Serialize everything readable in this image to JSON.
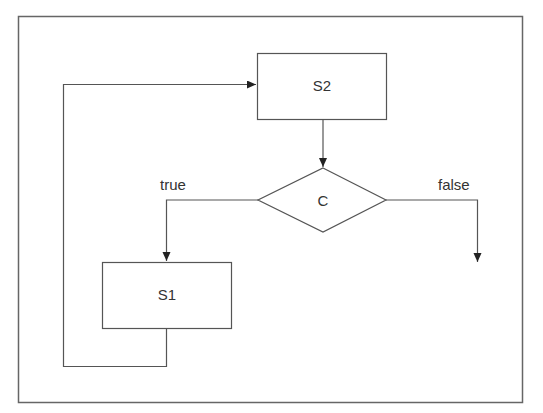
{
  "diagram": {
    "type": "flowchart",
    "colors": {
      "line": "#555555",
      "text": "#333333",
      "background": "#ffffff",
      "frame": "#666666"
    },
    "nodes": [
      {
        "id": "S2",
        "label": "S2",
        "shape": "rectangle"
      },
      {
        "id": "C",
        "label": "C",
        "shape": "diamond"
      },
      {
        "id": "S1",
        "label": "S1",
        "shape": "rectangle"
      }
    ],
    "edges": [
      {
        "from": "S2",
        "to": "C",
        "label": ""
      },
      {
        "from": "C",
        "to": "S1",
        "label": "true"
      },
      {
        "from": "C",
        "to": "exit",
        "label": "false"
      },
      {
        "from": "S1",
        "to": "S2",
        "label": ""
      }
    ],
    "labels": {
      "s2": "S2",
      "c": "C",
      "s1": "S1",
      "true_branch": "true",
      "false_branch": "false"
    }
  }
}
